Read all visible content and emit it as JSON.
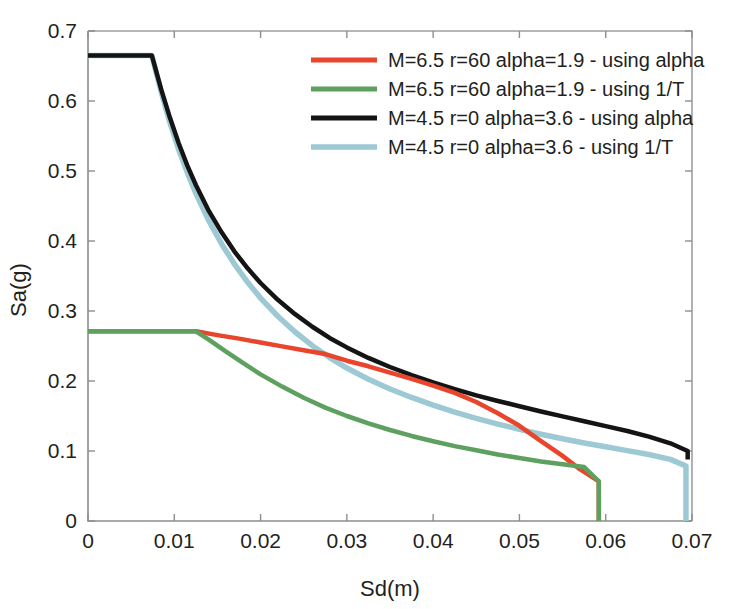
{
  "chart_data": {
    "type": "line",
    "title": "",
    "xlabel": "Sd(m)",
    "ylabel": "Sa(g)",
    "xlim": [
      0,
      0.07
    ],
    "ylim": [
      0,
      0.7
    ],
    "xticks": [
      0,
      0.01,
      0.02,
      0.03,
      0.04,
      0.05,
      0.06,
      0.07
    ],
    "xticklabels": [
      "0",
      "0.01",
      "0.02",
      "0.03",
      "0.04",
      "0.05",
      "0.06",
      "0.07"
    ],
    "yticks": [
      0,
      0.1,
      0.2,
      0.3,
      0.4,
      0.5,
      0.6,
      0.7
    ],
    "yticklabels": [
      "0",
      "0.1",
      "0.2",
      "0.3",
      "0.4",
      "0.5",
      "0.6",
      "0.7"
    ],
    "grid": false,
    "legend_position": "top-right",
    "series": [
      {
        "name": "M=6.5 r=60 alpha=1.9 - using alpha",
        "color": "#e8452c",
        "linewidth": 4.5,
        "points": [
          [
            0.0,
            0.271
          ],
          [
            0.0125,
            0.271
          ],
          [
            0.015,
            0.2655
          ],
          [
            0.0175,
            0.2605
          ],
          [
            0.02,
            0.255
          ],
          [
            0.0225,
            0.2495
          ],
          [
            0.025,
            0.244
          ],
          [
            0.0275,
            0.2385
          ],
          [
            0.03,
            0.229
          ],
          [
            0.0325,
            0.221
          ],
          [
            0.035,
            0.212
          ],
          [
            0.0375,
            0.203
          ],
          [
            0.04,
            0.1935
          ],
          [
            0.0425,
            0.183
          ],
          [
            0.045,
            0.17
          ],
          [
            0.0475,
            0.154
          ],
          [
            0.05,
            0.136
          ],
          [
            0.0525,
            0.114
          ],
          [
            0.055,
            0.093
          ],
          [
            0.057,
            0.074
          ],
          [
            0.0592,
            0.0565
          ],
          [
            0.0592,
            0.0
          ]
        ]
      },
      {
        "name": "M=6.5 r=60 alpha=1.9 - using 1/T",
        "color": "#5ea05f",
        "linewidth": 4.5,
        "points": [
          [
            0.0,
            0.271
          ],
          [
            0.0125,
            0.271
          ],
          [
            0.014,
            0.259
          ],
          [
            0.016,
            0.242
          ],
          [
            0.018,
            0.2255
          ],
          [
            0.02,
            0.2095
          ],
          [
            0.0225,
            0.192
          ],
          [
            0.025,
            0.176
          ],
          [
            0.0275,
            0.162
          ],
          [
            0.03,
            0.15
          ],
          [
            0.0325,
            0.1395
          ],
          [
            0.035,
            0.13
          ],
          [
            0.0375,
            0.1215
          ],
          [
            0.04,
            0.114
          ],
          [
            0.0425,
            0.107
          ],
          [
            0.045,
            0.101
          ],
          [
            0.0475,
            0.095
          ],
          [
            0.05,
            0.09
          ],
          [
            0.0525,
            0.085
          ],
          [
            0.055,
            0.081
          ],
          [
            0.0575,
            0.077
          ],
          [
            0.0592,
            0.0565
          ],
          [
            0.0592,
            0.0
          ]
        ]
      },
      {
        "name": "M=4.5 r=0 alpha=3.6 - using alpha",
        "color": "#141414",
        "linewidth": 4.5,
        "points": [
          [
            0.0,
            0.665
          ],
          [
            0.0074,
            0.665
          ],
          [
            0.0085,
            0.616
          ],
          [
            0.0095,
            0.576
          ],
          [
            0.0105,
            0.54
          ],
          [
            0.0115,
            0.508
          ],
          [
            0.0125,
            0.48
          ],
          [
            0.014,
            0.443
          ],
          [
            0.0155,
            0.412
          ],
          [
            0.017,
            0.3845
          ],
          [
            0.0185,
            0.361
          ],
          [
            0.02,
            0.34
          ],
          [
            0.022,
            0.316
          ],
          [
            0.024,
            0.2955
          ],
          [
            0.026,
            0.2775
          ],
          [
            0.028,
            0.2615
          ],
          [
            0.03,
            0.248
          ],
          [
            0.0325,
            0.233
          ],
          [
            0.035,
            0.22
          ],
          [
            0.0375,
            0.2085
          ],
          [
            0.04,
            0.198
          ],
          [
            0.0425,
            0.1885
          ],
          [
            0.045,
            0.1795
          ],
          [
            0.0475,
            0.1715
          ],
          [
            0.05,
            0.164
          ],
          [
            0.0525,
            0.1565
          ],
          [
            0.055,
            0.1495
          ],
          [
            0.0575,
            0.1425
          ],
          [
            0.06,
            0.1355
          ],
          [
            0.0625,
            0.1285
          ],
          [
            0.065,
            0.1205
          ],
          [
            0.0675,
            0.111
          ],
          [
            0.0695,
            0.1
          ],
          [
            0.0695,
            0.088
          ]
        ]
      },
      {
        "name": "M=4.5 r=0 alpha=3.6 - using 1/T",
        "color": "#9dc9d4",
        "linewidth": 5.5,
        "points": [
          [
            0.0,
            0.665
          ],
          [
            0.0074,
            0.665
          ],
          [
            0.0085,
            0.612
          ],
          [
            0.0095,
            0.569
          ],
          [
            0.0105,
            0.531
          ],
          [
            0.0115,
            0.498
          ],
          [
            0.0125,
            0.468
          ],
          [
            0.014,
            0.429
          ],
          [
            0.0155,
            0.3955
          ],
          [
            0.017,
            0.3665
          ],
          [
            0.0185,
            0.341
          ],
          [
            0.02,
            0.3185
          ],
          [
            0.022,
            0.2925
          ],
          [
            0.024,
            0.27
          ],
          [
            0.026,
            0.2505
          ],
          [
            0.028,
            0.2335
          ],
          [
            0.03,
            0.2185
          ],
          [
            0.0325,
            0.2025
          ],
          [
            0.035,
            0.1885
          ],
          [
            0.0375,
            0.1765
          ],
          [
            0.04,
            0.1655
          ],
          [
            0.0425,
            0.1555
          ],
          [
            0.045,
            0.1465
          ],
          [
            0.0475,
            0.1385
          ],
          [
            0.05,
            0.131
          ],
          [
            0.0525,
            0.124
          ],
          [
            0.055,
            0.1175
          ],
          [
            0.0575,
            0.1115
          ],
          [
            0.06,
            0.106
          ],
          [
            0.0625,
            0.1005
          ],
          [
            0.065,
            0.095
          ],
          [
            0.0675,
            0.088
          ],
          [
            0.0693,
            0.0785
          ],
          [
            0.0693,
            0.0
          ]
        ]
      }
    ]
  },
  "legend": {
    "entries": [
      {
        "label": "M=6.5 r=60 alpha=1.9 - using alpha",
        "swatch_color": "#e8452c"
      },
      {
        "label": "M=6.5 r=60 alpha=1.9 - using 1/T",
        "swatch_color": "#5ea05f"
      },
      {
        "label": "M=4.5 r=0 alpha=3.6 - using alpha",
        "swatch_color": "#141414"
      },
      {
        "label": "M=4.5 r=0 alpha=3.6 - using 1/T",
        "swatch_color": "#9dc9d4"
      }
    ]
  },
  "axes": {
    "x_title": "Sd(m)",
    "y_title": "Sa(g)",
    "axis_color": "#8d8d8d"
  }
}
